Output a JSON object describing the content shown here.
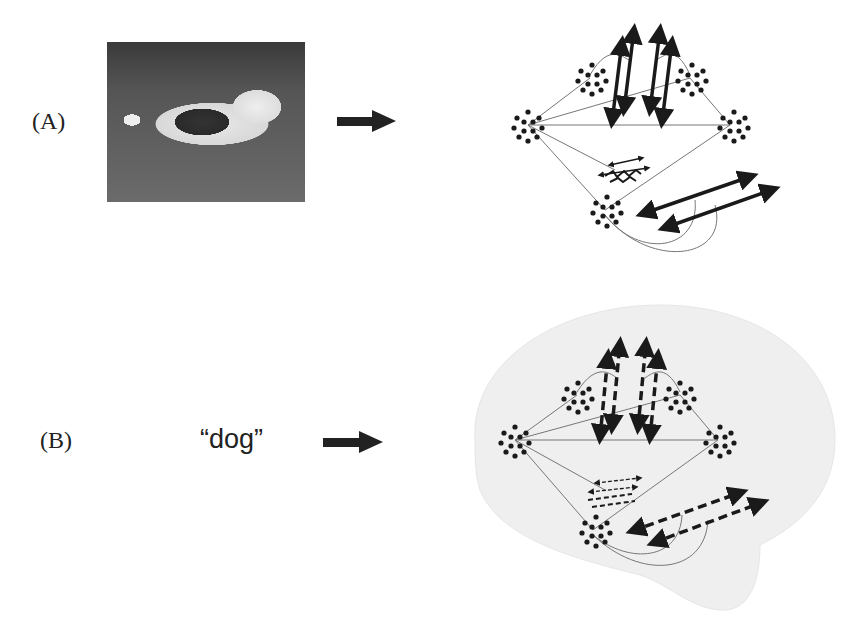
{
  "panels": [
    {
      "label": "(A)",
      "stimulus_type": "image",
      "stimulus_description": "photo of a dog (spaniel) standing on grass",
      "connector": "arrow-right"
    },
    {
      "label": "(B)",
      "stimulus_type": "word",
      "stimulus_text": "“dog”",
      "connector": "arrow-right"
    }
  ],
  "network": {
    "node_clusters": 5,
    "panel_a_arrows": "solid",
    "panel_b_arrows": "dashed",
    "panel_b_background": "brain-outline"
  },
  "colors": {
    "ink": "#1a1a1a",
    "line": "#777777",
    "brain": "#efefef"
  }
}
